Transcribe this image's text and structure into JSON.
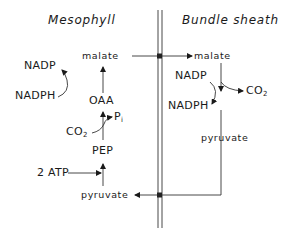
{
  "diagram": {
    "type": "C4 photosynthesis pathway (NADP-malic enzyme type)",
    "regions": {
      "left_title": "Mesophyll",
      "right_title": "Bundle sheath"
    },
    "mesophyll": {
      "malate": "malate",
      "nadp": "NADP",
      "nadph": "NADPH",
      "oaa": "OAA",
      "co2": "CO",
      "co2_sub": "2",
      "pi": "P",
      "pi_sub": "i",
      "pep": "PEP",
      "atp": "2 ATP",
      "pyruvate": "pyruvate"
    },
    "bundle_sheath": {
      "malate": "malate",
      "nadp": "NADP",
      "nadph": "NADPH",
      "co2": "CO",
      "co2_sub": "2",
      "pyruvate": "pyruvate"
    },
    "edges": [
      {
        "from": "mesophyll.pyruvate",
        "to": "mesophyll.pep",
        "with": "2 ATP"
      },
      {
        "from": "mesophyll.pep",
        "to": "mesophyll.oaa",
        "with": "CO2",
        "releases": "Pi"
      },
      {
        "from": "mesophyll.oaa",
        "to": "mesophyll.malate",
        "coupled": "NADPH -> NADP"
      },
      {
        "from": "mesophyll.malate",
        "to": "bundle_sheath.malate",
        "crosses": "cell wall"
      },
      {
        "from": "bundle_sheath.malate",
        "to": "bundle_sheath.pyruvate",
        "coupled": "NADP -> NADPH",
        "releases": "CO2"
      },
      {
        "from": "bundle_sheath.pyruvate",
        "to": "mesophyll.pyruvate",
        "crosses": "cell wall"
      }
    ]
  }
}
